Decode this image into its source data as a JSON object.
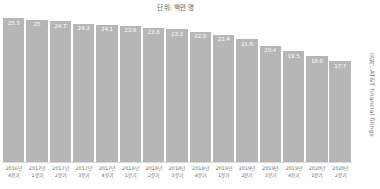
{
  "unit_caption": "단위: 백만 명",
  "source_credit": "출처: AT&T financial filings",
  "chart_data": {
    "type": "bar",
    "title": "",
    "subtitle": "",
    "xlabel": "",
    "ylabel": "단위: 백만 명",
    "ylim": [
      0,
      26
    ],
    "grid": false,
    "legend": "none",
    "bar_color": "#b6b6b6",
    "value_label_color": "#ffffff",
    "categories": [
      "2016년 4분기",
      "2017년 1분기",
      "2017년 2분기",
      "2017년 3분기",
      "2017년 4분기",
      "2018년 1분기",
      "2018년 2분기",
      "2018년 3분기",
      "2018년 4분기",
      "2019년 1분기",
      "2019년 2분기",
      "2019년 3분기",
      "2019년 4분기",
      "2020년 1분기",
      "2020년 2분기"
    ],
    "category_lines": [
      [
        "2016년",
        "4분기"
      ],
      [
        "2017년",
        "1분기"
      ],
      [
        "2017년",
        "2분기"
      ],
      [
        "2017년",
        "3분기"
      ],
      [
        "2017년",
        "4분기"
      ],
      [
        "2018년",
        "1분기"
      ],
      [
        "2018년",
        "2분기"
      ],
      [
        "2018년",
        "3분기"
      ],
      [
        "2018년",
        "4분기"
      ],
      [
        "2019년",
        "1분기"
      ],
      [
        "2019년",
        "2분기"
      ],
      [
        "2019년",
        "3분기"
      ],
      [
        "2019년",
        "4분기"
      ],
      [
        "2020년",
        "1분기"
      ],
      [
        "2020년",
        "2분기"
      ]
    ],
    "values": [
      25.3,
      25,
      24.7,
      24.3,
      24.1,
      23.9,
      23.6,
      23.3,
      22.9,
      22.4,
      21.6,
      20.4,
      19.5,
      18.6,
      17.7
    ],
    "value_labels": [
      "25.3",
      "25",
      "24.7",
      "24.3",
      "24.1",
      "23.9",
      "23.6",
      "23.3",
      "22.9",
      "22.4",
      "21.6",
      "20.4",
      "19.5",
      "18.6",
      "17.7"
    ]
  }
}
